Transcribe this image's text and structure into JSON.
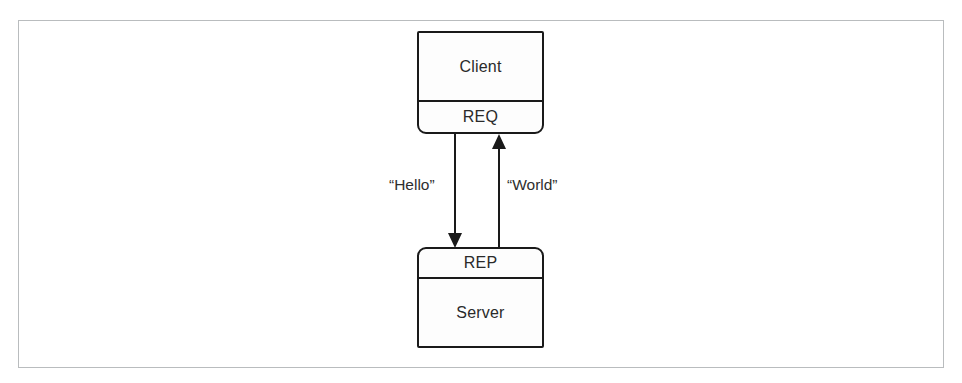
{
  "figure": {
    "type": "diagram",
    "subtype": "request-reply-socket-flow",
    "frame": {
      "visible": true,
      "border_color": "#b9bcbe"
    },
    "background_color": "#ffffff",
    "line_color": "#1a1a1a",
    "text_color": "#2a2a2a"
  },
  "nodes": [
    {
      "id": "client",
      "title": "Client",
      "socket": "REQ",
      "socket_position": "bottom"
    },
    {
      "id": "server",
      "title": "Server",
      "socket": "REP",
      "socket_position": "top"
    }
  ],
  "arrows": [
    {
      "id": "request",
      "label": "“Hello”",
      "direction": "down",
      "from": "client",
      "to": "server"
    },
    {
      "id": "reply",
      "label": "“World”",
      "direction": "up",
      "from": "server",
      "to": "client"
    }
  ]
}
